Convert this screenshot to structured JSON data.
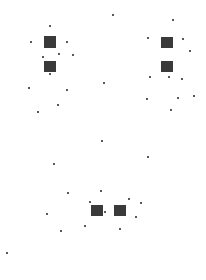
{
  "figure": {
    "width": 206,
    "height": 280,
    "background": "#ffffff",
    "dot_color": "#222222",
    "groups": [
      {
        "name": "top-left",
        "grids": [
          {
            "x": 44,
            "y": 36,
            "w": 12,
            "h": 12
          },
          {
            "x": 44,
            "y": 61,
            "w": 12,
            "h": 11
          }
        ],
        "dots": [
          [
            50,
            26
          ],
          [
            31,
            42
          ],
          [
            67,
            42
          ],
          [
            59,
            54
          ],
          [
            73,
            55
          ],
          [
            43,
            57
          ],
          [
            50,
            74
          ],
          [
            29,
            88
          ],
          [
            67,
            90
          ],
          [
            58,
            105
          ],
          [
            38,
            112
          ]
        ]
      },
      {
        "name": "top-right",
        "grids": [
          {
            "x": 161,
            "y": 37,
            "w": 12,
            "h": 11
          },
          {
            "x": 161,
            "y": 61,
            "w": 12,
            "h": 11
          }
        ],
        "dots": [
          [
            113,
            15
          ],
          [
            173,
            20
          ],
          [
            148,
            38
          ],
          [
            183,
            39
          ],
          [
            190,
            51
          ],
          [
            150,
            77
          ],
          [
            169,
            77
          ],
          [
            182,
            79
          ],
          [
            104,
            83
          ],
          [
            147,
            99
          ],
          [
            178,
            98
          ],
          [
            194,
            96
          ],
          [
            171,
            110
          ]
        ]
      },
      {
        "name": "bottom",
        "grids": [
          {
            "x": 91,
            "y": 205,
            "w": 12,
            "h": 11
          },
          {
            "x": 114,
            "y": 205,
            "w": 12,
            "h": 11
          }
        ],
        "dots": [
          [
            102,
            141
          ],
          [
            148,
            157
          ],
          [
            54,
            164
          ],
          [
            68,
            193
          ],
          [
            101,
            191
          ],
          [
            90,
            202
          ],
          [
            129,
            199
          ],
          [
            141,
            203
          ],
          [
            47,
            214
          ],
          [
            105,
            212
          ],
          [
            136,
            217
          ],
          [
            85,
            226
          ],
          [
            120,
            229
          ],
          [
            61,
            231
          ],
          [
            7,
            253
          ]
        ]
      }
    ]
  }
}
